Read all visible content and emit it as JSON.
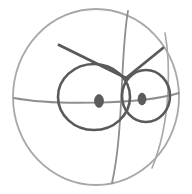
{
  "artwork": {
    "title": "Angry face sphere sketch",
    "medium": "pencil line drawing",
    "background_color": "#ffffff",
    "canvas": {
      "width": 192,
      "height": 194
    }
  },
  "palette": {
    "outline_light": "#a8a8a8",
    "guide_mid": "#8f8f8f",
    "feature_dark": "#5a5a5a",
    "pupil": "#5c5c5c"
  },
  "shapes": {
    "sphere": {
      "label": "sphere-outline",
      "cx": 96,
      "cy": 97,
      "rx": 83,
      "ry": 88,
      "stroke_width": 1.8,
      "color": "#a8a8a8"
    },
    "equator": {
      "label": "equator-line",
      "path": "M 14 98 C 50 105, 140 105, 179 93",
      "stroke_width": 2.0,
      "color": "#9a9a9a"
    },
    "meridian_main": {
      "label": "meridian-curve",
      "path": "M 128 11 C 120 55, 124 130, 112 183",
      "stroke_width": 1.8,
      "color": "#a0a0a0"
    },
    "meridian_right": {
      "label": "meridian-right-curve",
      "path": "M 165 33 C 170 60, 172 120, 152 168",
      "stroke_width": 1.6,
      "color": "#b0b0b0"
    },
    "left_eye": {
      "label": "left-eye-outline",
      "cx": 94,
      "cy": 97,
      "rx": 36,
      "ry": 33,
      "stroke_width": 2.6,
      "color": "#5a5a5a"
    },
    "right_eye": {
      "label": "right-eye-outline",
      "cx": 146,
      "cy": 96,
      "rx": 24,
      "ry": 26,
      "stroke_width": 2.6,
      "color": "#5a5a5a"
    },
    "left_pupil": {
      "label": "left-pupil",
      "cx": 99,
      "cy": 101,
      "rx": 4.5,
      "ry": 6.5,
      "color": "#5c5c5c"
    },
    "right_pupil": {
      "label": "right-pupil",
      "cx": 142,
      "cy": 99,
      "rx": 4.0,
      "ry": 6.0,
      "color": "#5c5c5c"
    },
    "left_brow": {
      "label": "left-eyebrow",
      "path": "M 59 45 L 126 78",
      "stroke_width": 3.0,
      "color": "#5a5a5a"
    },
    "right_brow": {
      "label": "right-eyebrow",
      "path": "M 126 78 L 163 48",
      "stroke_width": 2.8,
      "color": "#5a5a5a"
    },
    "brow_junction": {
      "label": "eyebrow-junction-point",
      "x": 126,
      "y": 78
    }
  },
  "chart_data": {
    "type": "scatter",
    "xlabel": "",
    "ylabel": "",
    "categories": [
      "sphere-outline",
      "equator-line",
      "meridian-curve",
      "meridian-right-curve",
      "left-eye-outline",
      "right-eye-outline",
      "left-pupil",
      "right-pupil",
      "left-eyebrow",
      "right-eyebrow"
    ],
    "values": [
      1,
      1,
      1,
      1,
      1,
      1,
      1,
      1,
      1,
      1
    ]
  }
}
